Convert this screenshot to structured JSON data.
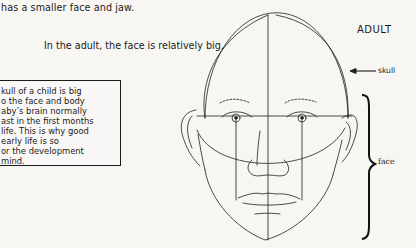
{
  "page": {
    "line_top": "has a smaller face and jaw.",
    "line_adult_face": "In the adult, the face is relatively big.",
    "sidebar_box": {
      "lines": [
        "kull of a child is big",
        "o the face and body",
        "aby’s brain normally",
        "ast in the first months",
        " life. This is why good",
        "early life is so",
        "or the development",
        "mind."
      ]
    }
  },
  "illustration": {
    "title": "ADULT",
    "labels": {
      "skull": "skull",
      "face": "face"
    },
    "icons": [
      "skull-arrow-icon",
      "face-brace-icon",
      "adult-face-drawing"
    ],
    "line_color": "#1e1e1e"
  }
}
